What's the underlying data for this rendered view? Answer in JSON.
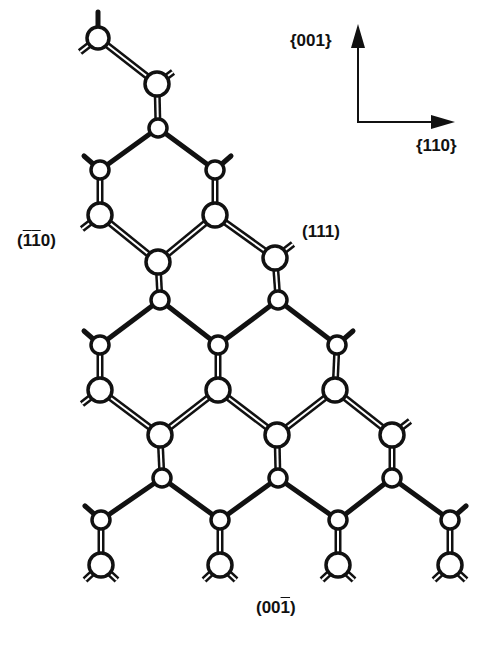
{
  "figure": {
    "axes": {
      "vertical_label": "{001}",
      "horizontal_label": "{110}"
    },
    "surface_labels": {
      "left": {
        "open": "(",
        "bar1": "1",
        "bar2": "1",
        "rest": "0)"
      },
      "right": "(111)",
      "bottom": {
        "pre": "(00",
        "bar": "1",
        "post": ")"
      }
    },
    "colors": {
      "ink": "#111111",
      "paper": "#ffffff"
    },
    "atoms": [
      {
        "x": 98,
        "y": 38,
        "r": 11
      },
      {
        "x": 157,
        "y": 84,
        "r": 12
      },
      {
        "x": 158,
        "y": 128,
        "r": 9
      },
      {
        "x": 100,
        "y": 170,
        "r": 9
      },
      {
        "x": 215,
        "y": 170,
        "r": 9
      },
      {
        "x": 100,
        "y": 215,
        "r": 12
      },
      {
        "x": 215,
        "y": 215,
        "r": 12
      },
      {
        "x": 158,
        "y": 262,
        "r": 12
      },
      {
        "x": 275,
        "y": 258,
        "r": 12
      },
      {
        "x": 160,
        "y": 300,
        "r": 9
      },
      {
        "x": 278,
        "y": 300,
        "r": 9
      },
      {
        "x": 100,
        "y": 345,
        "r": 9
      },
      {
        "x": 218,
        "y": 345,
        "r": 9
      },
      {
        "x": 337,
        "y": 345,
        "r": 9
      },
      {
        "x": 100,
        "y": 390,
        "r": 12
      },
      {
        "x": 218,
        "y": 390,
        "r": 12
      },
      {
        "x": 335,
        "y": 390,
        "r": 12
      },
      {
        "x": 160,
        "y": 435,
        "r": 12
      },
      {
        "x": 277,
        "y": 435,
        "r": 12
      },
      {
        "x": 392,
        "y": 435,
        "r": 12
      },
      {
        "x": 162,
        "y": 478,
        "r": 9
      },
      {
        "x": 278,
        "y": 478,
        "r": 9
      },
      {
        "x": 392,
        "y": 478,
        "r": 9
      },
      {
        "x": 101,
        "y": 520,
        "r": 9
      },
      {
        "x": 220,
        "y": 520,
        "r": 9
      },
      {
        "x": 338,
        "y": 520,
        "r": 9
      },
      {
        "x": 450,
        "y": 520,
        "r": 9
      },
      {
        "x": 101,
        "y": 565,
        "r": 12
      },
      {
        "x": 220,
        "y": 565,
        "r": 12
      },
      {
        "x": 338,
        "y": 565,
        "r": 12
      },
      {
        "x": 450,
        "y": 565,
        "r": 12
      }
    ],
    "single_bonds": [
      [
        2,
        3
      ],
      [
        2,
        4
      ],
      [
        9,
        11
      ],
      [
        9,
        12
      ],
      [
        10,
        12
      ],
      [
        10,
        13
      ],
      [
        20,
        23
      ],
      [
        20,
        24
      ],
      [
        21,
        24
      ],
      [
        21,
        25
      ],
      [
        22,
        25
      ],
      [
        22,
        26
      ]
    ],
    "double_bonds": [
      [
        0,
        1
      ],
      [
        1,
        2
      ],
      [
        3,
        5
      ],
      [
        4,
        6
      ],
      [
        5,
        7
      ],
      [
        6,
        7
      ],
      [
        6,
        8
      ],
      [
        7,
        9
      ],
      [
        8,
        10
      ],
      [
        11,
        14
      ],
      [
        12,
        15
      ],
      [
        13,
        16
      ],
      [
        14,
        17
      ],
      [
        15,
        17
      ],
      [
        15,
        18
      ],
      [
        16,
        18
      ],
      [
        16,
        19
      ],
      [
        17,
        20
      ],
      [
        18,
        21
      ],
      [
        19,
        22
      ],
      [
        23,
        27
      ],
      [
        24,
        28
      ],
      [
        25,
        29
      ],
      [
        26,
        30
      ]
    ],
    "single_stubs": [
      [
        98,
        38,
        98,
        12
      ],
      [
        100,
        170,
        84,
        156
      ],
      [
        215,
        170,
        231,
        156
      ],
      [
        100,
        345,
        84,
        331
      ],
      [
        337,
        345,
        353,
        331
      ],
      [
        101,
        520,
        85,
        506
      ],
      [
        450,
        520,
        466,
        506
      ]
    ],
    "double_stubs": [
      [
        98,
        38,
        80,
        52
      ],
      [
        157,
        84,
        173,
        72
      ],
      [
        100,
        215,
        82,
        229
      ],
      [
        275,
        258,
        293,
        244
      ],
      [
        100,
        390,
        82,
        404
      ],
      [
        392,
        435,
        410,
        421
      ],
      [
        101,
        565,
        85,
        580
      ],
      [
        101,
        565,
        117,
        580
      ],
      [
        220,
        565,
        204,
        580
      ],
      [
        220,
        565,
        236,
        580
      ],
      [
        338,
        565,
        322,
        580
      ],
      [
        338,
        565,
        354,
        580
      ],
      [
        450,
        565,
        434,
        580
      ],
      [
        450,
        565,
        466,
        580
      ]
    ]
  }
}
